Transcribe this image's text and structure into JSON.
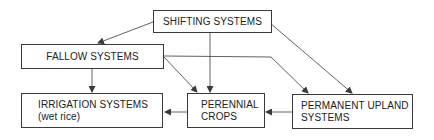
{
  "diagram": {
    "nodes": {
      "shifting": {
        "label": "SHIFTING SYSTEMS"
      },
      "fallow": {
        "label": "FALLOW SYSTEMS"
      },
      "irrigation": {
        "line1": "IRRIGATION SYSTEMS",
        "line2": "(wet rice)"
      },
      "perennial": {
        "line1": "PERENNIAL",
        "line2": "CROPS"
      },
      "permanent": {
        "line1": "PERMANENT UPLAND",
        "line2": "SYSTEMS"
      }
    },
    "edges": [
      {
        "from": "shifting",
        "to": "fallow"
      },
      {
        "from": "shifting",
        "to": "perennial"
      },
      {
        "from": "shifting",
        "to": "permanent"
      },
      {
        "from": "fallow",
        "to": "irrigation"
      },
      {
        "from": "fallow",
        "to": "perennial"
      },
      {
        "from": "fallow",
        "to": "permanent"
      },
      {
        "from": "perennial",
        "to": "irrigation"
      },
      {
        "from": "permanent",
        "to": "perennial"
      }
    ],
    "colors": {
      "line": "#3a3a3a",
      "text": "#222222"
    }
  }
}
